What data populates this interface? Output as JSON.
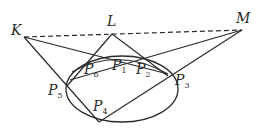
{
  "diagram": {
    "points": {
      "K": {
        "label": "K",
        "x": 24,
        "y": 37
      },
      "L": {
        "label": "L",
        "x": 112,
        "y": 34
      },
      "M": {
        "label": "M",
        "x": 242,
        "y": 30
      },
      "P1": {
        "label": "P",
        "sub": "1"
      },
      "P2": {
        "label": "P",
        "sub": "2"
      },
      "P3": {
        "label": "P",
        "sub": "3"
      },
      "P4": {
        "label": "P",
        "sub": "4"
      },
      "P5": {
        "label": "P",
        "sub": "5"
      },
      "P6": {
        "label": "P",
        "sub": "6"
      }
    },
    "ellipse": {
      "cx": 122,
      "cy": 89,
      "rx": 56,
      "ry": 33
    },
    "dashed_line": "K-L-M",
    "stroke_color": "#2a2a2a"
  }
}
